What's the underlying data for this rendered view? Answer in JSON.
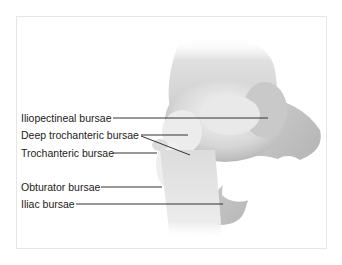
{
  "diagram": {
    "labels": [
      {
        "id": "iliopectineal",
        "text": "Iliopectineal bursae"
      },
      {
        "id": "deep-trochanteric",
        "text": "Deep trochanteric bursae"
      },
      {
        "id": "trochanteric",
        "text": "Trochanteric bursae"
      },
      {
        "id": "obturator",
        "text": "Obturator bursae"
      },
      {
        "id": "iliac",
        "text": "Iliac bursae"
      }
    ],
    "colors": {
      "leader_line": "#333333",
      "bone_light": "#f2f2f2",
      "bone_shadow": "#9a9a9a"
    }
  }
}
